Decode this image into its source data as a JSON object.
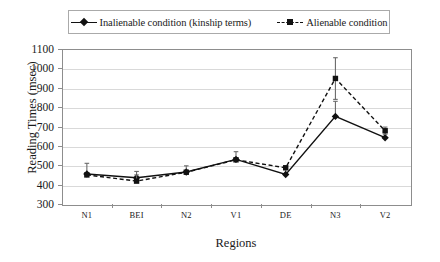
{
  "chart_data": {
    "type": "line",
    "title": "",
    "xlabel": "Regions",
    "ylabel": "Reading Times (msec)",
    "categories": [
      "N1",
      "BEI",
      "N2",
      "V1",
      "DE",
      "N3",
      "V2"
    ],
    "ylim": [
      300,
      1100
    ],
    "yticks": [
      300,
      400,
      500,
      600,
      700,
      800,
      900,
      1000,
      1100
    ],
    "grid": true,
    "legend_position": "top",
    "series": [
      {
        "name": "Inalienable condition (kinship terms)",
        "marker": "diamond",
        "linestyle": "solid",
        "color": "#111111",
        "values": [
          455,
          435,
          465,
          530,
          452,
          752,
          642
        ],
        "error_upper": [
          510,
          468,
          497,
          570,
          490,
          830,
          672
        ],
        "error_lower": [
          452,
          412,
          462,
          528,
          450,
          748,
          640
        ]
      },
      {
        "name": "Alienable condition",
        "marker": "square",
        "linestyle": "dashed",
        "color": "#111111",
        "values": [
          450,
          418,
          464,
          528,
          487,
          948,
          678
        ],
        "error_upper": [
          450,
          450,
          464,
          528,
          487,
          1055,
          697
        ],
        "error_lower": [
          450,
          418,
          464,
          528,
          487,
          840,
          660
        ]
      }
    ]
  },
  "legend": {
    "entries": [
      {
        "label": "Inalienable condition (kinship terms)",
        "marker": "diamond",
        "linestyle": "solid"
      },
      {
        "label": "Alienable condition",
        "marker": "square",
        "linestyle": "dashed"
      }
    ]
  }
}
